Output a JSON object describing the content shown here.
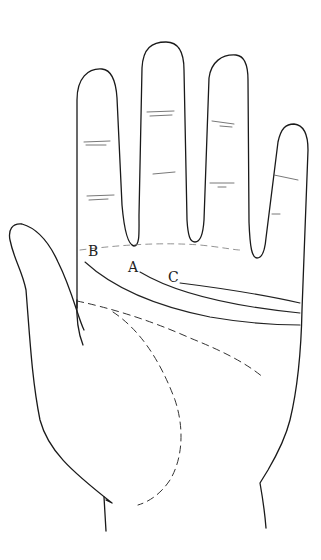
{
  "diagram": {
    "type": "palm-line-drawing",
    "labels": [
      {
        "id": "A",
        "text": "A",
        "x": 128,
        "y": 272
      },
      {
        "id": "B",
        "text": "B",
        "x": 88,
        "y": 256
      },
      {
        "id": "C",
        "text": "C",
        "x": 168,
        "y": 282
      }
    ],
    "lines": [
      {
        "label": "A",
        "style": "solid",
        "description": "middle line from A toward right edge"
      },
      {
        "label": "B",
        "style": "solid",
        "description": "lower line from B sweeping to right edge"
      },
      {
        "label": "C",
        "style": "solid",
        "description": "upper short line from C to right edge"
      },
      {
        "label": "",
        "style": "dashed",
        "description": "diagonal line across palm"
      },
      {
        "label": "",
        "style": "dashed",
        "description": "curved line around thumb base"
      }
    ],
    "colors": {
      "background": "#ffffff",
      "ink": "#1a1a1a"
    }
  }
}
